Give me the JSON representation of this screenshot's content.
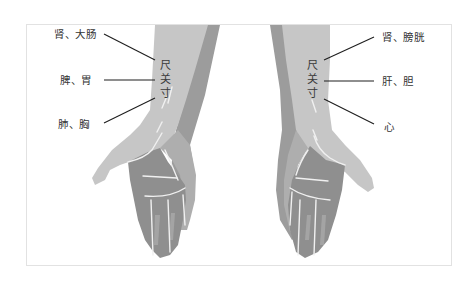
{
  "diagram": {
    "title": "",
    "colors": {
      "skin_light": "#c8c8c8",
      "skin_mid": "#b0b0b0",
      "skin_dark": "#9a9a9a",
      "palm": "#8e8e8e",
      "crease": "#f2f2f2",
      "line": "#222222",
      "frame": "#e2e2e2"
    },
    "left_hand": {
      "positions": [
        "尺",
        "关",
        "寸"
      ],
      "labels": [
        {
          "text": "肾、大肠",
          "points_to": "尺"
        },
        {
          "text": "脾、胃",
          "points_to": "关"
        },
        {
          "text": "肺、胸",
          "points_to": "寸"
        }
      ]
    },
    "right_hand": {
      "positions": [
        "尺",
        "关",
        "寸"
      ],
      "labels": [
        {
          "text": "肾、膀胱",
          "points_to": "尺"
        },
        {
          "text": "肝、胆",
          "points_to": "关"
        },
        {
          "text": "心",
          "points_to": "寸"
        }
      ]
    }
  }
}
